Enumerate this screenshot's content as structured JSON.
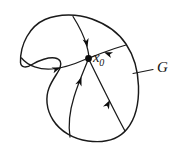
{
  "figure": {
    "kind": "phase-portrait-diagram",
    "background_color": "#ffffff",
    "ink_color": "#1a1a1a",
    "width": 174,
    "height": 146,
    "labels": {
      "equilibrium": {
        "base": "x",
        "subscript": "0",
        "full": "x0",
        "x": 93,
        "y": 50
      },
      "region": {
        "text": "G",
        "x": 157,
        "y": 60
      }
    },
    "equilibrium_point": {
      "name": "x0",
      "cx": 88.5,
      "cy": 58.5,
      "r": 3.4,
      "color": "#0d0d0d"
    },
    "boundary": {
      "name": "region-boundary-G",
      "closed": true,
      "stroke_width": 1.45,
      "path": "M 20.5 62.5 C 20 44 30 26 45 19.5 C 60 13 78 14 92 19 C 106 24 118 32 126 44 C 134 56 138 70 138.5 86 C 139 102 136 118 127 129 C 118 140 103 143 88 141 C 73 139 60 131 53 120 C 46 109 45.5 97 49 88 C 52.5 79 58 73 60 68 C 62 63 60.5 59 55 58 C 49 57 39 60 32 64.5 C 26 68.5 21 67.5 20.5 62.5 Z"
    },
    "leader": {
      "name": "leader-line-to-G",
      "path": "M 153 69.5 L 133 73.5",
      "stroke_width": 1.2
    },
    "trajectories": [
      {
        "name": "trajectory-from-left",
        "direction": "rightward-into-equilibrium",
        "path": "M 21.5 58 C 28 66 40 70 52 69 C 64 68 76 63.5 85 59.5",
        "arrow": {
          "x": 60.5,
          "y": 67.5,
          "angle": -20
        }
      },
      {
        "name": "trajectory-from-top",
        "direction": "downward-into-equilibrium",
        "path": "M 73 16.5 C 79 26 84 36 86.5 45 C 88.5 52 89 56 88.7 58",
        "arrow": {
          "x": 87.5,
          "y": 47,
          "angle": 77
        }
      },
      {
        "name": "trajectory-from-upper-right",
        "direction": "leftward-into-equilibrium",
        "path": "M 126 45 C 119 47 110 50 102 53 C 96.5 55 92 57 89.5 58",
        "arrow": {
          "x": 104,
          "y": 52.3,
          "angle": 200
        }
      },
      {
        "name": "trajectory-from-bottom-left",
        "direction": "upward-into-equilibrium",
        "path": "M 70 137 C 68 124 70 110 74 97 C 78 84 84 70 88 60",
        "arrow": {
          "x": 81.5,
          "y": 77,
          "angle": -70
        }
      },
      {
        "name": "trajectory-from-bottom-right",
        "direction": "upward-into-equilibrium",
        "path": "M 125 131 C 119 120 112 106 105 92 C 98 78 92 66 89 59.5",
        "arrow": {
          "x": 110,
          "y": 100,
          "angle": -63
        }
      }
    ]
  }
}
